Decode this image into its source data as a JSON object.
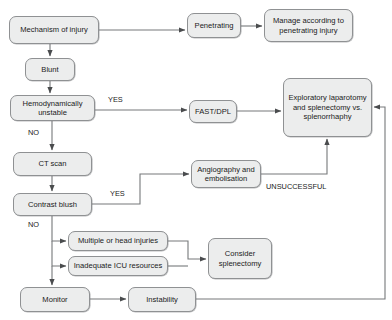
{
  "diagram": {
    "colors": {
      "node_fill": "#eceded",
      "node_border": "#8f9193",
      "line": "#6e7072",
      "text": "#1b1b1b",
      "background": "#ffffff"
    },
    "nodes": [
      {
        "id": "mechanism",
        "label": "Mechanism of injury",
        "x": 9,
        "y": 16,
        "w": 90,
        "h": 28
      },
      {
        "id": "penetrating",
        "label": "Penetrating",
        "x": 187,
        "y": 13,
        "w": 54,
        "h": 25
      },
      {
        "id": "manage",
        "label": "Manage according to penetrating injury",
        "x": 264,
        "y": 9,
        "w": 89,
        "h": 33
      },
      {
        "id": "blunt",
        "label": "Blunt",
        "x": 25,
        "y": 58,
        "w": 50,
        "h": 23
      },
      {
        "id": "hemodynamic",
        "label": "Hemodynamically unstable",
        "x": 10,
        "y": 95,
        "w": 85,
        "h": 26
      },
      {
        "id": "fastdpl",
        "label": "FAST/DPL",
        "x": 189,
        "y": 100,
        "w": 48,
        "h": 23
      },
      {
        "id": "exploratory",
        "label": "Exploratory laparotomy and splenectomy vs. splenorrhaphy",
        "x": 283,
        "y": 78,
        "w": 89,
        "h": 59
      },
      {
        "id": "ctscan",
        "label": "CT scan",
        "x": 13,
        "y": 152,
        "w": 79,
        "h": 24
      },
      {
        "id": "angio",
        "label": "Angiography and embolisation",
        "x": 191,
        "y": 160,
        "w": 70,
        "h": 28
      },
      {
        "id": "contrast",
        "label": "Contrast blush",
        "x": 13,
        "y": 193,
        "w": 79,
        "h": 23
      },
      {
        "id": "multiple",
        "label": "Multiple or head injuries",
        "x": 68,
        "y": 231,
        "w": 100,
        "h": 20
      },
      {
        "id": "icu",
        "label": "Inadequate ICU resources",
        "x": 68,
        "y": 256,
        "w": 100,
        "h": 20
      },
      {
        "id": "consider",
        "label": "Consider splenectomy",
        "x": 208,
        "y": 238,
        "w": 64,
        "h": 41
      },
      {
        "id": "monitor",
        "label": "Monitor",
        "x": 20,
        "y": 287,
        "w": 70,
        "h": 25
      },
      {
        "id": "instability",
        "label": "Instability",
        "x": 128,
        "y": 287,
        "w": 68,
        "h": 25
      }
    ],
    "edge_labels": [
      {
        "id": "yes-hemodynamic",
        "text": "YES",
        "x": 108,
        "y": 96
      },
      {
        "id": "no-hemodynamic",
        "text": "NO",
        "x": 28,
        "y": 129
      },
      {
        "id": "yes-contrast",
        "text": "YES",
        "x": 110,
        "y": 190
      },
      {
        "id": "no-contrast",
        "text": "NO",
        "x": 28,
        "y": 221
      },
      {
        "id": "unsuccessful",
        "text": "UNSUCCESSFUL",
        "x": 266,
        "y": 183
      }
    ],
    "edges": [
      {
        "id": "mechanism-to-penetrating",
        "from": "mechanism",
        "to": "penetrating"
      },
      {
        "id": "penetrating-to-manage",
        "from": "penetrating",
        "to": "manage"
      },
      {
        "id": "mechanism-to-blunt",
        "from": "mechanism",
        "to": "blunt"
      },
      {
        "id": "blunt-to-hemodynamic",
        "from": "blunt",
        "to": "hemodynamic"
      },
      {
        "id": "hemodynamic-to-fastdpl",
        "from": "hemodynamic",
        "to": "fastdpl",
        "label": "YES"
      },
      {
        "id": "fastdpl-to-exploratory",
        "from": "fastdpl",
        "to": "exploratory"
      },
      {
        "id": "hemodynamic-to-ctscan",
        "from": "hemodynamic",
        "to": "ctscan",
        "label": "NO"
      },
      {
        "id": "ctscan-to-contrast",
        "from": "ctscan",
        "to": "contrast"
      },
      {
        "id": "contrast-to-angio",
        "from": "contrast",
        "to": "angio",
        "label": "YES"
      },
      {
        "id": "angio-to-exploratory",
        "from": "angio",
        "to": "exploratory",
        "label": "UNSUCCESSFUL"
      },
      {
        "id": "contrast-to-multiple",
        "from": "contrast",
        "to": "multiple",
        "label": "NO"
      },
      {
        "id": "contrast-to-icu",
        "from": "contrast",
        "to": "icu",
        "label": "NO"
      },
      {
        "id": "multiple-to-consider",
        "from": "multiple",
        "to": "consider"
      },
      {
        "id": "icu-to-consider",
        "from": "icu",
        "to": "consider"
      },
      {
        "id": "contrast-to-monitor",
        "from": "contrast",
        "to": "monitor",
        "label": "NO"
      },
      {
        "id": "monitor-to-instability",
        "from": "monitor",
        "to": "instability"
      },
      {
        "id": "instability-to-exploratory",
        "from": "instability",
        "to": "exploratory"
      }
    ]
  }
}
